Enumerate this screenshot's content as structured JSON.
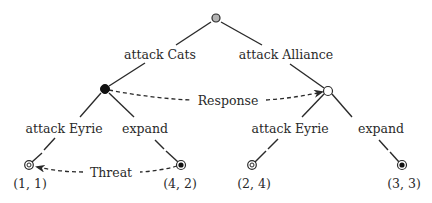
{
  "colors": {
    "ink": "#2a2a2a",
    "root_fill": "#b3b3b3",
    "decision_fill": "#111111",
    "open_fill": "#ffffff",
    "background": "#ffffff"
  },
  "nodes": {
    "root": {
      "x": 216,
      "y": 18,
      "type": "chance-gray"
    },
    "cats": {
      "x": 105,
      "y": 89,
      "type": "filled"
    },
    "alliance": {
      "x": 328,
      "y": 91,
      "type": "open"
    },
    "leaf_1_1": {
      "x": 29,
      "y": 165,
      "type": "double-ring",
      "payoff": "(1, 1)"
    },
    "leaf_4_2": {
      "x": 181,
      "y": 165,
      "type": "ring-filled",
      "payoff": "(4, 2)"
    },
    "leaf_2_4": {
      "x": 252,
      "y": 165,
      "type": "double-ring",
      "payoff": "(2, 4)"
    },
    "leaf_3_3": {
      "x": 402,
      "y": 165,
      "type": "ring-filled",
      "payoff": "(3, 3)"
    }
  },
  "edge_labels": {
    "attack_cats": "attack Cats",
    "attack_alliance": "attack Alliance",
    "left_attack_eyrie": "attack Eyrie",
    "left_expand": "expand",
    "right_attack_eyrie": "attack Eyrie",
    "right_expand": "expand"
  },
  "annotations": {
    "response": "Response",
    "threat": "Threat"
  },
  "payoffs": {
    "leaf_1_1": "(1, 1)",
    "leaf_4_2": "(4, 2)",
    "leaf_2_4": "(2, 4)",
    "leaf_3_3": "(3, 3)"
  }
}
